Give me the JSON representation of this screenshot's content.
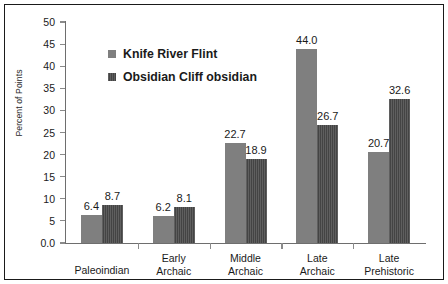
{
  "chart_data": {
    "type": "bar",
    "title": "",
    "xlabel": "",
    "ylabel": "Percent of Points",
    "ylim": [
      0,
      50
    ],
    "ytick_labels": [
      "50",
      "45",
      "40",
      "35",
      "30",
      "25",
      "20",
      "15",
      "10",
      "5",
      "0.0"
    ],
    "ytick_values": [
      50,
      45,
      40,
      35,
      30,
      25,
      20,
      15,
      10,
      5,
      0
    ],
    "grid": false,
    "legend_position": "inside-upper-left",
    "categories": [
      "Paleoindian",
      "Early Archaic",
      "Middle Archaic",
      "Late Archaic",
      "Late Prehistoric"
    ],
    "category_lines": [
      [
        "Paleoindian"
      ],
      [
        "Early",
        "Archaic"
      ],
      [
        "Middle",
        "Archaic"
      ],
      [
        "Late",
        "Archaic"
      ],
      [
        "Late",
        "Prehistoric"
      ]
    ],
    "series": [
      {
        "name": "Knife River Flint",
        "color": "#7f7f7f",
        "values": [
          6.4,
          6.2,
          22.7,
          44.0,
          20.7
        ],
        "labels": [
          "6.4",
          "6.2",
          "22.7",
          "44.0",
          "20.7"
        ]
      },
      {
        "name": "Obsidian Cliff obsidian",
        "color": "#4d4d4d",
        "values": [
          8.7,
          8.1,
          18.9,
          26.7,
          32.6
        ],
        "labels": [
          "8.7",
          "8.1",
          "18.9",
          "26.7",
          "32.6"
        ]
      }
    ]
  },
  "figure": {
    "background": "#ffffff",
    "border_color": "#1a1a1a",
    "axis_color": "#6e6e6e"
  }
}
